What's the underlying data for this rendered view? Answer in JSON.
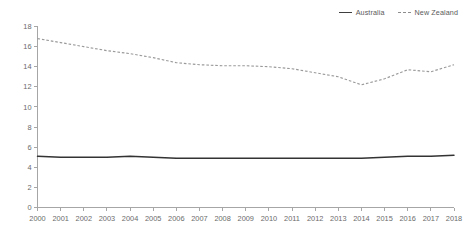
{
  "chart_data": {
    "type": "line",
    "title": "",
    "subtitle": "",
    "xlabel": "",
    "ylabel": "",
    "xlim": [
      2000,
      2018
    ],
    "ylim": [
      0,
      18
    ],
    "ytick_step": 2,
    "grid": false,
    "legend_position": "top-right",
    "categories": [
      "2000",
      "2001",
      "2002",
      "2003",
      "2004",
      "2005",
      "2006",
      "2007",
      "2008",
      "2009",
      "2010",
      "2011",
      "2012",
      "2013",
      "2014",
      "2015",
      "2016",
      "2017",
      "2018"
    ],
    "x": [
      2000,
      2001,
      2002,
      2003,
      2004,
      2005,
      2006,
      2007,
      2008,
      2009,
      2010,
      2011,
      2012,
      2013,
      2014,
      2015,
      2016,
      2017,
      2018
    ],
    "yticks": [
      0,
      2,
      4,
      6,
      8,
      10,
      12,
      14,
      16,
      18
    ],
    "ytick_labels": [
      "0",
      "2",
      "4",
      "6",
      "8",
      "10",
      "12",
      "14",
      "16",
      "18"
    ],
    "series": [
      {
        "name": "Australia",
        "style": "solid",
        "color": "#333333",
        "values": [
          5.1,
          5.0,
          5.0,
          5.0,
          5.1,
          5.0,
          4.9,
          4.9,
          4.9,
          4.9,
          4.9,
          4.9,
          4.9,
          4.9,
          4.9,
          5.0,
          5.1,
          5.1,
          5.2
        ]
      },
      {
        "name": "New Zealand",
        "style": "dashed",
        "color": "#9a9a9a",
        "values": [
          16.8,
          16.4,
          16.0,
          15.6,
          15.3,
          14.9,
          14.4,
          14.2,
          14.1,
          14.1,
          14.0,
          13.8,
          13.4,
          13.0,
          12.2,
          12.8,
          13.7,
          13.5,
          14.2
        ]
      }
    ]
  },
  "legend": {
    "items": [
      {
        "label": "Australia",
        "style": "solid"
      },
      {
        "label": "New Zealand",
        "style": "dashed"
      }
    ]
  }
}
